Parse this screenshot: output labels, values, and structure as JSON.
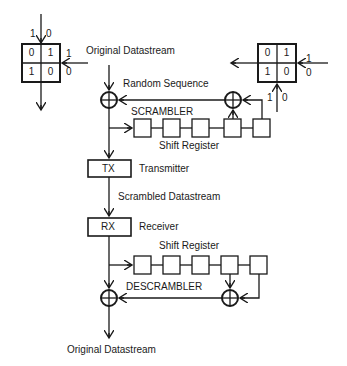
{
  "diagram": {
    "type": "scrambler-descrambler block diagram",
    "labels": {
      "original_in": "Original Datastream",
      "random_sequence": "Random Sequence",
      "scrambler": "SCRAMBLER",
      "shift_register_top": "Shift Register",
      "tx": "TX",
      "transmitter": "Transmitter",
      "scrambled": "Scrambled Datastream",
      "rx": "RX",
      "receiver": "Receiver",
      "shift_register_bottom": "Shift Register",
      "descrambler": "DESCRAMBLER",
      "original_out": "Original Datastream"
    },
    "xor_truth_table_left": {
      "top_inputs": [
        "1",
        "0"
      ],
      "side_inputs": [
        "1",
        "0"
      ],
      "cells": [
        [
          "0",
          "1"
        ],
        [
          "1",
          "0"
        ]
      ]
    },
    "xor_truth_table_right": {
      "bottom_inputs": [
        "1",
        "0"
      ],
      "side_inputs": [
        "1",
        "0"
      ],
      "cells": [
        [
          "0",
          "1"
        ],
        [
          "1",
          "0"
        ]
      ]
    },
    "shift_register_stages": 5,
    "colors": {
      "line": "#1a1a1a",
      "background": "#ffffff"
    }
  }
}
